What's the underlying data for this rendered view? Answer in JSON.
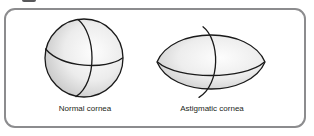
{
  "figure": {
    "panel": {
      "border_color": "#8c8c8e",
      "background_color": "#ffffff",
      "corner_radius_px": 11
    },
    "labels": {
      "normal": "Normal cornea",
      "astigmatic": "Astigmatic cornea"
    },
    "label_color": "#231f20",
    "shapes": [
      {
        "id": "normal-cornea",
        "name": "sphere",
        "label": "Normal cornea",
        "description": "Spherical cornea with evenly curved vertical and horizontal meridians",
        "center": [
          84,
          58
        ],
        "radius_x": 39,
        "radius_y": 39,
        "outline_color": "#1a1a1a",
        "fill_light": "#fdfdfd",
        "fill_dark": "#c9c9c9"
      },
      {
        "id": "astigmatic-cornea",
        "name": "lens",
        "label": "Astigmatic cornea",
        "description": "Football / lens shaped cornea, wider than tall with pointed horizontal tips",
        "center": [
          211,
          62
        ],
        "half_width": 54,
        "half_height": 36,
        "outline_color": "#1a1a1a",
        "fill_light": "#fdfdfd",
        "fill_dark": "#c9c9c9"
      }
    ],
    "meridians": {
      "count_per_shape": 2,
      "orientation": [
        "vertical",
        "horizontal"
      ],
      "line_color": "#1a1a1a"
    }
  }
}
